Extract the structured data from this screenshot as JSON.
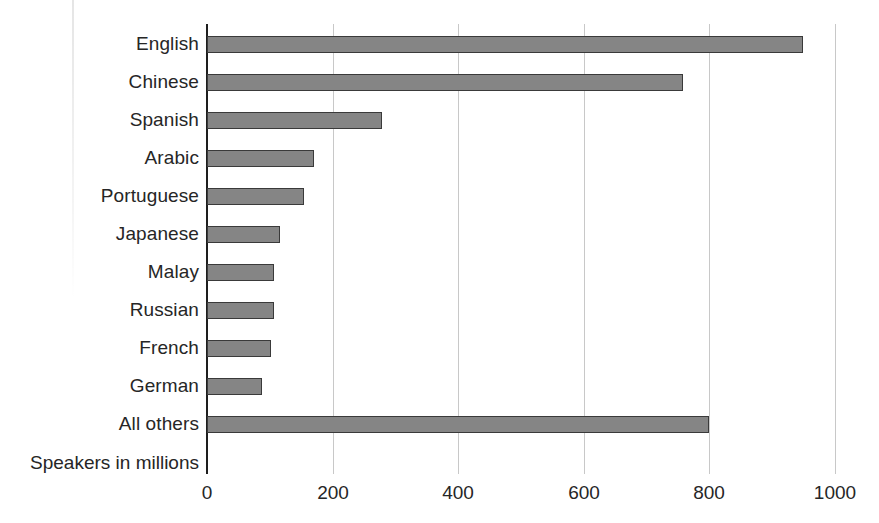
{
  "chart_data": {
    "type": "bar",
    "orientation": "horizontal",
    "title": "",
    "xlabel": "Speakers in millions",
    "ylabel": "",
    "categories": [
      "English",
      "Chinese",
      "Spanish",
      "Arabic",
      "Portuguese",
      "Japanese",
      "Malay",
      "Russian",
      "French",
      "German",
      "All others"
    ],
    "values": [
      950,
      758,
      279,
      170,
      154,
      116,
      107,
      107,
      102,
      87,
      800
    ],
    "axis_note": "Speakers in millions",
    "xlim": [
      0,
      1000
    ],
    "xticks": [
      0,
      200,
      400,
      600,
      800,
      1000
    ],
    "xtick_labels": [
      "0",
      "200",
      "400",
      "600",
      "800",
      "1000"
    ],
    "grid": true,
    "legend": false,
    "colors": {
      "bar_fill": "#858585",
      "bar_stroke": "#3a3a3a",
      "gridline": "#c8c8c8",
      "axis": "#1e1e1e",
      "text": "#262626",
      "background": "#ffffff"
    }
  }
}
